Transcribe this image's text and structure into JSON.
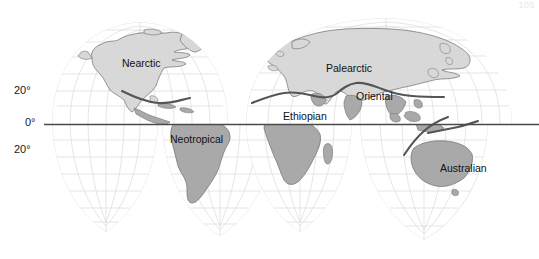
{
  "figure": {
    "title_visible": false,
    "page_number": "105",
    "projection": "interrupted-goode-homolosine",
    "background_color": "#ffffff",
    "ocean_color": "#ffffff",
    "graticule_color": "#dcdcdc",
    "outline_color": "#8a8a8a",
    "equator_color": "#444444",
    "boundary_line_color": "#555555",
    "land_light_color": "#d8d8d8",
    "land_dark_color": "#a9a9a9",
    "coastline_color": "#6e6e6e"
  },
  "axis": {
    "latitude_ticks": [
      {
        "label": "20°",
        "value": 20,
        "x": 21,
        "y": 91
      },
      {
        "label": "0°",
        "value": 0,
        "x": 29,
        "y": 123
      },
      {
        "label": "20°",
        "value": -20,
        "x": 21,
        "y": 150
      }
    ]
  },
  "regions": [
    {
      "name": "Nearctic",
      "label": "Nearctic",
      "x": 122,
      "y": 63,
      "fill": "light"
    },
    {
      "name": "Neotropical",
      "label": "Neotropical",
      "x": 172,
      "y": 139,
      "fill": "dark"
    },
    {
      "name": "Palearctic",
      "label": "Palearctic",
      "x": 327,
      "y": 68,
      "fill": "light"
    },
    {
      "name": "Ethiopian",
      "label": "Ethiopian",
      "x": 285,
      "y": 116,
      "fill": "dark"
    },
    {
      "name": "Oriental",
      "label": "Oriental",
      "x": 358,
      "y": 96,
      "fill": "dark"
    },
    {
      "name": "Australian",
      "label": "Australian",
      "x": 441,
      "y": 168,
      "fill": "dark"
    }
  ]
}
